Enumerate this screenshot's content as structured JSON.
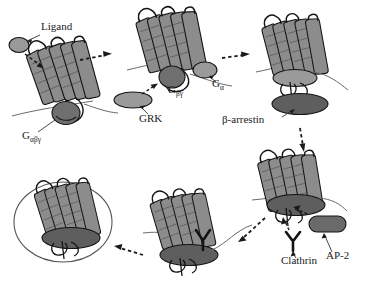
{
  "figure": {
    "width": 365,
    "height": 307,
    "background": "#ffffff"
  },
  "colors": {
    "outline": "#141414",
    "helix_fill": "#8c8c8c",
    "helix_shade": "#6e6e6e",
    "ligand_fill": "#9a9a9a",
    "g_alpha_fill": "#9a9a9a",
    "g_beta_gamma_fill": "#6f6f6f",
    "grk_fill": "#9a9a9a",
    "arrestin_fill": "#5e5e5e",
    "arrestin_light_fill": "#9a9a9a",
    "ap2_fill": "#6a6a6a",
    "vesicle_stroke": "#555555",
    "membrane_stroke": "#6a6a6a",
    "arrow": "#111111",
    "text": "#1a1a1a"
  },
  "labels": [
    {
      "id": "ligand",
      "text": "Ligand",
      "x": 41,
      "y": 27,
      "size": 11.5
    },
    {
      "id": "g_albega",
      "text": "G",
      "sub": "αβγ",
      "x": 22,
      "y": 136,
      "size": 11.5
    },
    {
      "id": "grk",
      "text": "GRK",
      "x": 139,
      "y": 119,
      "size": 11.5
    },
    {
      "id": "g_betagamma",
      "text": "G",
      "sub": "βγ",
      "x": 170,
      "y": 89,
      "size": 11.5
    },
    {
      "id": "g_alpha",
      "text": "G",
      "sub": "α",
      "x": 213,
      "y": 83,
      "size": 11.5
    },
    {
      "id": "beta_arrestin",
      "text": "β-arrestin",
      "x": 222,
      "y": 120,
      "size": 11.5
    },
    {
      "id": "clathrin",
      "text": "Clathrin",
      "x": 281,
      "y": 261,
      "size": 11.5
    },
    {
      "id": "ap2",
      "text": "AP-2",
      "x": 326,
      "y": 256,
      "size": 11.5
    }
  ],
  "stages": [
    {
      "id": "stage-1-ligand-binding",
      "name": "Ligand binding to inactive receptor with heterotrimeric G protein",
      "components": [
        "ligand",
        "seven-tm-receptor",
        "g-protein-alpha-beta-gamma"
      ]
    },
    {
      "id": "stage-2-g-protein-dissociation",
      "name": "G protein dissociation and GRK recruitment",
      "components": [
        "seven-tm-receptor",
        "g-alpha",
        "g-beta-gamma",
        "grk"
      ]
    },
    {
      "id": "stage-3-arrestin-binding",
      "name": "Beta-arrestin binding to phosphorylated receptor",
      "components": [
        "seven-tm-receptor",
        "beta-arrestin"
      ]
    },
    {
      "id": "stage-4-clathrin-ap2-recruitment",
      "name": "Clathrin and AP-2 recruitment to the arrestin-bound receptor",
      "components": [
        "seven-tm-receptor",
        "beta-arrestin",
        "clathrin",
        "ap2"
      ]
    },
    {
      "id": "stage-5-coated-pit",
      "name": "Receptor in forming clathrin-coated pit",
      "components": [
        "seven-tm-receptor",
        "beta-arrestin",
        "clathrin"
      ]
    },
    {
      "id": "stage-6-internalized-vesicle",
      "name": "Internalized receptor inside endocytic vesicle",
      "components": [
        "seven-tm-receptor",
        "beta-arrestin",
        "vesicle"
      ]
    }
  ],
  "arrows": [
    {
      "id": "arrow-1-to-2",
      "from": "stage-1-ligand-binding",
      "to": "stage-2-g-protein-dissociation",
      "style": "dashed"
    },
    {
      "id": "arrow-2-to-3",
      "from": "stage-2-g-protein-dissociation",
      "to": "stage-3-arrestin-binding",
      "style": "dashed"
    },
    {
      "id": "arrow-3-to-4",
      "from": "stage-3-arrestin-binding",
      "to": "stage-4-clathrin-ap2-recruitment",
      "style": "dashed"
    },
    {
      "id": "arrow-4-to-5",
      "from": "stage-4-clathrin-ap2-recruitment",
      "to": "stage-5-coated-pit",
      "style": "dashed"
    },
    {
      "id": "arrow-5-to-6",
      "from": "stage-5-coated-pit",
      "to": "stage-6-internalized-vesicle",
      "style": "dashed"
    },
    {
      "id": "arrow-ligand-to-receptor",
      "from": "ligand",
      "to": "stage-1-ligand-binding",
      "style": "dashed"
    },
    {
      "id": "leader-ligand",
      "from": "ligand-label",
      "to": "ligand",
      "style": "solid"
    },
    {
      "id": "leader-grk",
      "from": "grk-label",
      "to": "grk",
      "style": "solid"
    },
    {
      "id": "leader-grk-to-receptor",
      "from": "grk",
      "to": "stage-2-g-protein-dissociation",
      "style": "dashed"
    },
    {
      "id": "leader-g-alpha",
      "from": "g-alpha-label",
      "to": "g-alpha",
      "style": "solid"
    },
    {
      "id": "leader-beta-arrestin",
      "from": "beta-arrestin-label",
      "to": "beta-arrestin",
      "style": "solid"
    },
    {
      "id": "leader-clathrin",
      "from": "clathrin-label",
      "to": "clathrin",
      "style": "solid"
    },
    {
      "id": "leader-ap2",
      "from": "ap2-label",
      "to": "ap2",
      "style": "solid"
    },
    {
      "id": "leader-ap2-to-receptor",
      "from": "ap2",
      "to": "stage-4-clathrin-ap2-recruitment",
      "style": "dashed"
    },
    {
      "id": "leader-clathrin-to-receptor",
      "from": "clathrin",
      "to": "stage-4-clathrin-ap2-recruitment",
      "style": "dashed"
    }
  ]
}
